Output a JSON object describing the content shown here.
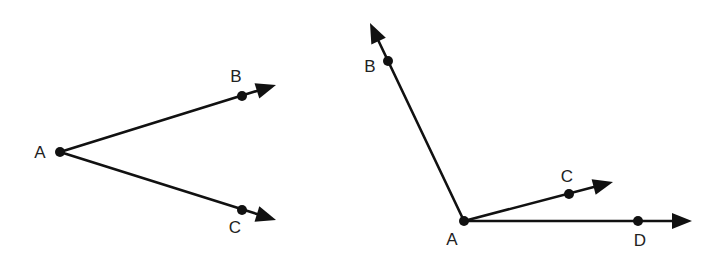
{
  "diagram": {
    "title": "",
    "colors": {
      "stroke": "#111111",
      "label": "#222222",
      "background": "#ffffff"
    },
    "figures": [
      {
        "name": "angle-BAC",
        "vertex": "A",
        "points": [
          {
            "label": "A",
            "x": 60,
            "y": 152,
            "lx": 40,
            "ly": 158
          },
          {
            "label": "B",
            "x": 242,
            "y": 96,
            "lx": 236,
            "ly": 82
          },
          {
            "label": "C",
            "x": 242,
            "y": 210,
            "lx": 235,
            "ly": 233
          }
        ],
        "rays": [
          {
            "from": "A",
            "through": "B",
            "tip": [
              276,
              85
            ]
          },
          {
            "from": "A",
            "through": "C",
            "tip": [
              276,
              220
            ]
          }
        ]
      },
      {
        "name": "angles-BAC-CAD",
        "vertex": "A",
        "points": [
          {
            "label": "A",
            "x": 464,
            "y": 221,
            "lx": 452,
            "ly": 245
          },
          {
            "label": "B",
            "x": 388,
            "y": 61,
            "lx": 370,
            "ly": 72
          },
          {
            "label": "C",
            "x": 569,
            "y": 194,
            "lx": 567,
            "ly": 182
          },
          {
            "label": "D",
            "x": 638,
            "y": 221,
            "lx": 640,
            "ly": 246
          }
        ],
        "rays": [
          {
            "from": "A",
            "through": "B",
            "tip": [
              370,
              23
            ]
          },
          {
            "from": "A",
            "through": "C",
            "tip": [
              613,
              182
            ]
          },
          {
            "from": "A",
            "through": "D",
            "tip": [
              692,
              221
            ]
          }
        ]
      }
    ]
  }
}
